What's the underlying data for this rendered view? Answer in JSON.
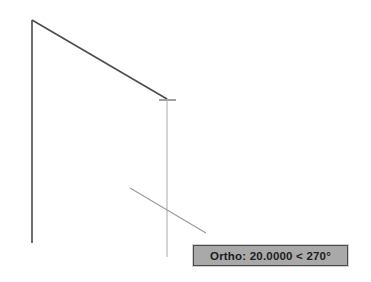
{
  "app": {
    "name": "CAD Drawing Canvas",
    "background_color": "#ffffff"
  },
  "tooltip": {
    "name": "dynamic-input-tooltip",
    "text": "Ortho: 20.0000 < 270°",
    "mode_label": "Ortho:",
    "distance": "20.0000",
    "separator": "<",
    "angle": "270°",
    "background_color": "#a9a9a9",
    "border_color": "#4a4a4a",
    "text_color": "#1c1c1c"
  },
  "geometry": {
    "committed_color": "#555555",
    "rubberband_color": "#b0b0b0",
    "crosshair_color": "#8a8a8a",
    "left_vertical_line": {
      "name": "existing-vertical-line",
      "x1": 32,
      "y1": 20,
      "x2": 32,
      "y2": 243
    },
    "diagonal_line": {
      "name": "existing-diagonal-line",
      "x1": 32,
      "y1": 20,
      "x2": 167,
      "y2": 99
    },
    "endpoint_tick": {
      "name": "endpoint-tick-marker",
      "x1": 159,
      "y1": 100,
      "x2": 176,
      "y2": 100
    },
    "rubberband_vertical": {
      "name": "rubberband-line",
      "x1": 167,
      "y1": 99,
      "x2": 167,
      "y2": 257
    },
    "crosshair": {
      "name": "crosshair-cursor",
      "center_x": 167,
      "center_y": 215,
      "horizontal_arm": {
        "x1": 130,
        "y1": 188,
        "x2": 206,
        "y2": 233
      }
    }
  }
}
